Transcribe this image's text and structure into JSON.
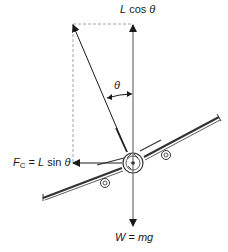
{
  "diagram": {
    "labels": {
      "lift_vertical": {
        "var": "L",
        "text": " cos ",
        "theta": "θ"
      },
      "theta_angle": "θ",
      "centripetal": {
        "var": "F",
        "sub": "C",
        "eq": " = ",
        "var2": "L",
        "text": " sin ",
        "theta": "θ"
      },
      "weight": {
        "var": "W",
        "eq": " = ",
        "rhs": "mg"
      }
    },
    "colors": {
      "line": "#1a1a1a",
      "vertical_line": "#555555",
      "dashed": "#8a8a8a",
      "aircraft": "#333333"
    }
  }
}
